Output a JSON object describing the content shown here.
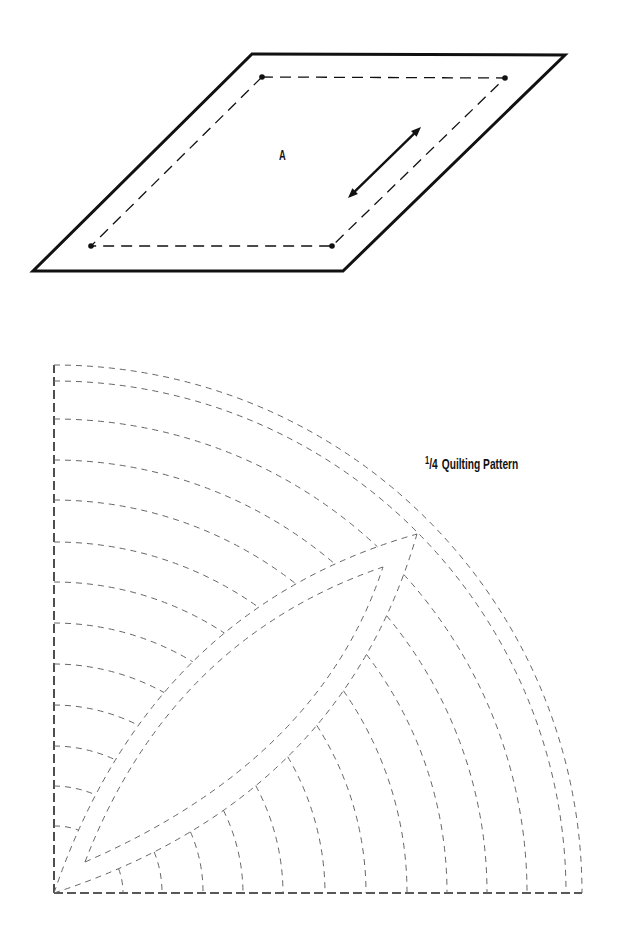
{
  "template_piece": {
    "label": "A",
    "outer_outline": [
      [
        252,
        54
      ],
      [
        565,
        55
      ],
      [
        343,
        271
      ],
      [
        33,
        271
      ]
    ],
    "seam_line": [
      [
        262,
        77
      ],
      [
        505,
        78
      ],
      [
        332,
        246
      ],
      [
        91,
        246
      ]
    ],
    "grain_arrow": {
      "from": [
        348,
        198
      ],
      "to": [
        421,
        127
      ]
    },
    "stroke_color": "#111111"
  },
  "quilting_pattern": {
    "title_fraction_num": "1",
    "title_fraction_den": "4",
    "title_text": "Quilting Pattern",
    "origin": [
      54,
      893
    ],
    "outer_arc_radii": [
      528,
      512
    ],
    "left_arc_radii": [
      474,
      433,
      393,
      351,
      311,
      270,
      229,
      188,
      147,
      107,
      67
    ],
    "bottom_arc_radii": [
      69,
      108,
      149,
      189,
      229,
      271,
      312,
      353,
      393,
      433,
      473
    ],
    "leaf_outer": {
      "start": [
        54,
        893
      ],
      "apex": [
        417,
        534
      ],
      "upper_control": [
        150,
        610
      ],
      "lower_control": [
        340,
        800
      ]
    },
    "leaf_inner": {
      "start": [
        85,
        862
      ],
      "apex": [
        383,
        567
      ],
      "upper_control": [
        170,
        640
      ],
      "lower_control": [
        320,
        760
      ]
    },
    "dash_color": "#666666",
    "border_color": "#222222"
  }
}
